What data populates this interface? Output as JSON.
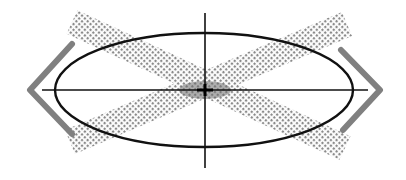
{
  "diagram": {
    "colors": {
      "background": "#ffffff",
      "ellipse_stroke": "#111111",
      "axis_stroke": "#111111",
      "band_dot": "#8a8a8a",
      "chevron_stroke": "#808080"
    },
    "ellipse": {
      "cx": 204,
      "cy": 90,
      "rx": 149,
      "ry": 57
    },
    "axes": {
      "horizontal": {
        "x1": 42,
        "y1": 90,
        "x2": 368,
        "y2": 90
      },
      "vertical": {
        "x1": 205,
        "y1": 13,
        "x2": 205,
        "y2": 168
      }
    },
    "bands": [
      {
        "name": "band-descending",
        "x1": 72,
        "y1": 22,
        "x2": 345,
        "y2": 148,
        "width": 26
      },
      {
        "name": "band-ascending",
        "x1": 70,
        "y1": 142,
        "x2": 347,
        "y2": 24,
        "width": 26
      }
    ],
    "chevrons": {
      "left": {
        "points": "72,44 30,90 72,134",
        "glyph": "chevron-left"
      },
      "right": {
        "points": "341,50 380,90 343,130",
        "glyph": "chevron-right"
      }
    }
  }
}
